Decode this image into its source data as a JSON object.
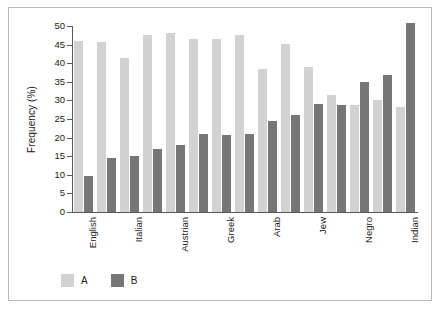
{
  "chart_data": {
    "type": "bar",
    "title": "",
    "subtitle": "",
    "xlabel": "",
    "ylabel": "Frequency (%)",
    "ylim": [
      0,
      50
    ],
    "ytick_step": 5,
    "ytick_labels": [
      "0",
      "5",
      "10",
      "15",
      "20",
      "25",
      "30",
      "35",
      "40",
      "45",
      "50"
    ],
    "grid": false,
    "legend_position": "bottom-left",
    "categories": [
      "English",
      "",
      "Italian",
      "",
      "Austrian",
      "",
      "Greek",
      "",
      "Arab",
      "",
      "Jew",
      "",
      "Negro",
      "",
      "Indian"
    ],
    "visible_tick_labels": [
      "English",
      "Italian",
      "Austrian",
      "Greek",
      "Arab",
      "Jew",
      "Negro",
      "Indian"
    ],
    "series": [
      {
        "name": "A",
        "color": "#d2d2d2",
        "values": [
          46.0,
          45.7,
          41.4,
          47.6,
          48.2,
          46.5,
          46.4,
          47.5,
          38.4,
          45.2,
          39.1,
          31.4,
          28.8,
          30.2,
          28.3
        ]
      },
      {
        "name": "B",
        "color": "#767676",
        "values": [
          9.7,
          14.5,
          15.1,
          16.9,
          18.0,
          21.0,
          20.6,
          21.1,
          24.6,
          26.1,
          29.1,
          28.7,
          35.0,
          36.9,
          50.8
        ]
      }
    ]
  },
  "legend": {
    "items": [
      {
        "label": "A",
        "color": "#d2d2d2"
      },
      {
        "label": "B",
        "color": "#767676"
      }
    ]
  },
  "axis": {
    "y_title": "Frequency (%)"
  },
  "colors": {
    "series_a": "#d2d2d2",
    "series_b": "#767676",
    "axis": "#5a5a5a",
    "frame": "#b8b8b8",
    "text": "#1a1a1a",
    "background": "#ffffff"
  }
}
